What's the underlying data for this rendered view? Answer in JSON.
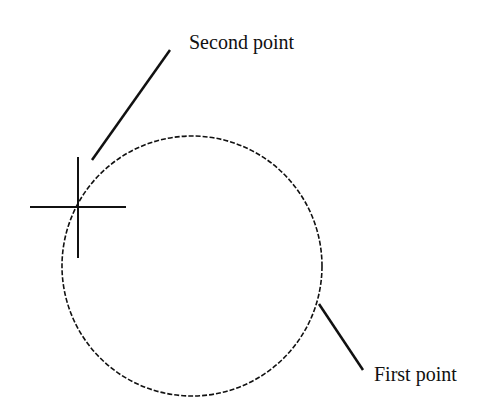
{
  "diagram": {
    "type": "circle-two-point-construction",
    "labels": {
      "second_point": "Second point",
      "first_point": "First point"
    },
    "circle": {
      "cx": 192,
      "cy": 265,
      "r": 130,
      "style": "dashed"
    },
    "cursor": {
      "x": 78,
      "y": 207,
      "icon": "crosshair-cursor-icon"
    },
    "colors": {
      "stroke": "#111111",
      "background": "#ffffff"
    }
  }
}
